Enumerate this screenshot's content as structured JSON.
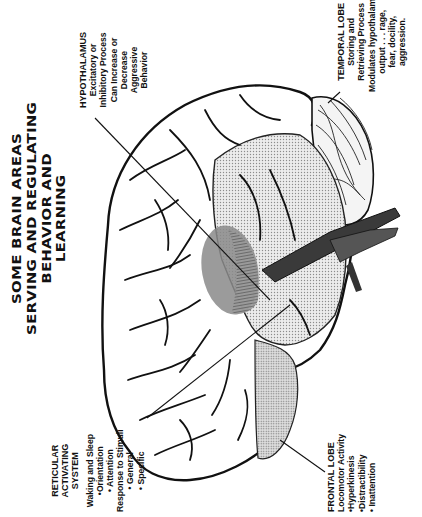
{
  "diagram": {
    "title_lines": [
      "SOME BRAIN AREAS",
      "SERVING AND REGULATING",
      "BEHAVIOR AND",
      "LEARNING"
    ],
    "orientation": "rotated -90deg (text reads bottom-to-top)",
    "colors": {
      "ink": "#111111",
      "background": "#ffffff",
      "stipple_light": "#d6d6d6",
      "stipple_medium": "#bdbdbd",
      "hypothalamus_shade": "#8a8a8a",
      "brainstem": "#444444"
    },
    "labels": {
      "hypothalamus": {
        "heading": "HYPOTHALAMUS",
        "lines": [
          "Excitatory or",
          "Inhibitory Process",
          "Can Increase or",
          "Decrease",
          "Aggressive",
          "Behavior"
        ]
      },
      "temporal_lobe": {
        "heading": "TEMPORAL LOBE",
        "lines": [
          "Storing and",
          "Retrieving Process",
          "Modulates hypothalamic",
          "output . . . rage,",
          "fear, docility,",
          "aggression."
        ]
      },
      "reticular_activating_system": {
        "heading_lines": [
          "RETICULAR",
          "ACTIVATING",
          "SYSTEM"
        ],
        "lines": [
          "Waking and Sleep",
          "•Orientation",
          "• Attention",
          "Response to Stimuli",
          "• General",
          "• Specific"
        ]
      },
      "frontal_lobe": {
        "heading": "FRONTAL LOBE",
        "lines": [
          "Locomotor Activity",
          "•Hyperkinesis",
          "•Distractibility",
          "• Inattention"
        ]
      }
    }
  }
}
